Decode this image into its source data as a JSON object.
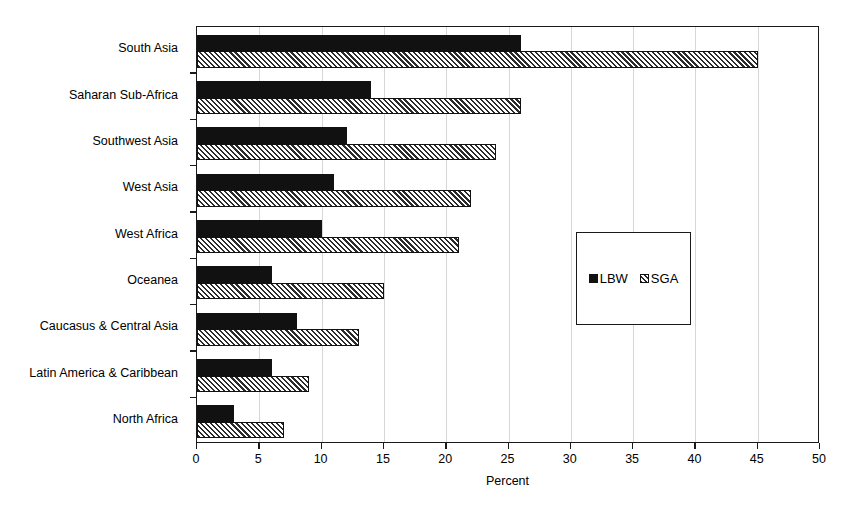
{
  "chart_data": {
    "type": "bar",
    "orientation": "horizontal",
    "title": "",
    "xlabel": "Percent",
    "ylabel": "",
    "xlim": [
      0,
      50
    ],
    "xticks": [
      0,
      5,
      10,
      15,
      20,
      25,
      30,
      35,
      40,
      45,
      50
    ],
    "grid": "vertical",
    "legend_position": "center-right-inset",
    "categories": [
      "South Asia",
      "Saharan Sub-Africa",
      "Southwest Asia",
      "West Asia",
      "West Africa",
      "Oceanea",
      "Caucasus & Central Asia",
      "Latin America & Caribbean",
      "North Africa"
    ],
    "series": [
      {
        "name": "LBW",
        "pattern": "solid-black",
        "color": "#111111",
        "values": [
          26,
          14,
          12,
          11,
          10,
          6,
          8,
          6,
          3
        ]
      },
      {
        "name": "SGA",
        "pattern": "diagonal-hatch",
        "color": "#2b2b2b",
        "values": [
          45,
          26,
          24,
          22,
          21,
          15,
          13,
          9,
          7
        ]
      }
    ]
  },
  "legend": {
    "entries": [
      {
        "label": "LBW",
        "swatch": "solid-square-icon"
      },
      {
        "label": "SGA",
        "swatch": "hatched-square-icon"
      }
    ]
  },
  "axis": {
    "x_title": "Percent",
    "tick_labels": [
      "0",
      "5",
      "10",
      "15",
      "20",
      "25",
      "30",
      "35",
      "40",
      "45",
      "50"
    ]
  }
}
